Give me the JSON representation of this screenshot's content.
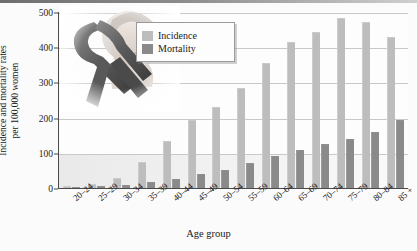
{
  "chart_data": {
    "type": "bar",
    "title": "",
    "xlabel": "Age group",
    "ylabel": "Incidence and mortality rates per 100,000 women",
    "ylim": [
      0,
      500
    ],
    "yticks": [
      0,
      100,
      200,
      300,
      400,
      500
    ],
    "grid": true,
    "legend_position": "top-left-inset",
    "categories": [
      "20–24",
      "25–29",
      "30–34",
      "35–39",
      "40–44",
      "45–49",
      "50–54",
      "55–59",
      "60–64",
      "65–69",
      "70–74",
      "75–79",
      "80–84",
      "85 +"
    ],
    "series": [
      {
        "name": "Incidence",
        "color": "#bdbdbd",
        "values": [
          2,
          9,
          27,
          70,
          130,
          190,
          228,
          282,
          352,
          412,
          440,
          480,
          470,
          425
        ]
      },
      {
        "name": "Mortality",
        "color": "#8a8a8a",
        "values": [
          0,
          2,
          5,
          14,
          23,
          38,
          48,
          68,
          88,
          105,
          122,
          135,
          155,
          190
        ]
      }
    ]
  },
  "axes": {
    "ylabel_line1": "Incidence and mortality rates",
    "ylabel_line2": "per 100,000 women",
    "xlabel": "Age group"
  },
  "legend": {
    "items": [
      {
        "label": "Incidence",
        "color": "#bdbdbd"
      },
      {
        "label": "Mortality",
        "color": "#8a8a8a"
      }
    ]
  },
  "artwork": {
    "ribbon_name": "awareness-ribbon",
    "portrait_name": "woman-portrait"
  }
}
